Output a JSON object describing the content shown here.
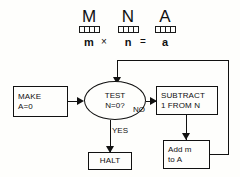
{
  "diagram": {
    "background_color": "#fefefc",
    "line_color": "#111111"
  },
  "registers": {
    "cells_per_register": 4,
    "items": [
      {
        "letter": "M",
        "variable": "m"
      },
      {
        "letter": "N",
        "variable": "n"
      },
      {
        "letter": "A",
        "variable": "a"
      }
    ],
    "equation": {
      "left": "m",
      "times": "×",
      "middle": "n",
      "equals": "=",
      "right": "a"
    }
  },
  "flow": {
    "nodes": {
      "make": {
        "line1": "MAKE",
        "line2": "A=0"
      },
      "test": {
        "line1": "TEST",
        "line2": "N=0?"
      },
      "subtract": {
        "line1": "SUBTRACT",
        "line2": "1 FROM N"
      },
      "add": {
        "line1": "Add m",
        "line2": "to A"
      },
      "halt": {
        "line1": "HALT"
      }
    },
    "edge_labels": {
      "no": "NO",
      "yes": "YES"
    }
  }
}
